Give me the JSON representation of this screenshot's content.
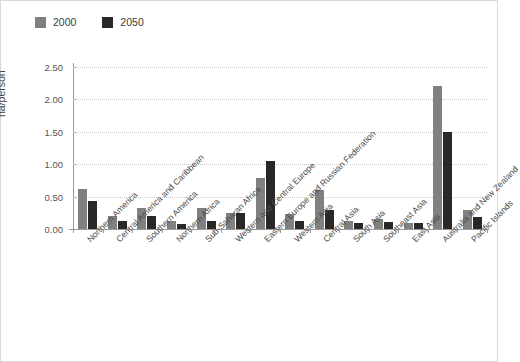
{
  "chart_data": {
    "type": "bar",
    "title": "",
    "xlabel": "",
    "ylabel": "ha/person",
    "ylim": [
      0,
      2.5
    ],
    "ytick_labels": [
      "0.00",
      "0.50",
      "1.00",
      "1.50",
      "2.00",
      "2.50"
    ],
    "ytick_values": [
      0,
      0.5,
      1.0,
      1.5,
      2.0,
      2.5
    ],
    "grid": true,
    "legend_position": "top-left",
    "categories": [
      "Northern America",
      "Central America and Caribbean",
      "Southern America",
      "Northern Africa",
      "Sub-Saharan Africa",
      "Western and Central Europe",
      "Eastern Europe and Russian Federation",
      "Western Asia",
      "Central Asia",
      "South Asia",
      "Southeast Asia",
      "East Asia",
      "Australia and New Zealand",
      "Pacific Islands"
    ],
    "series": [
      {
        "name": "2000",
        "color": "#808080",
        "values": [
          0.61,
          0.2,
          0.33,
          0.13,
          0.33,
          0.25,
          0.78,
          0.23,
          0.6,
          0.12,
          0.15,
          0.1,
          2.2,
          0.3
        ]
      },
      {
        "name": "2050",
        "color": "#282828",
        "values": [
          0.44,
          0.13,
          0.2,
          0.07,
          0.13,
          0.24,
          1.05,
          0.13,
          0.3,
          0.09,
          0.11,
          0.09,
          1.5,
          0.18
        ]
      }
    ]
  },
  "legend": {
    "items": [
      {
        "label": "2000",
        "color": "#808080"
      },
      {
        "label": "2050",
        "color": "#282828"
      }
    ]
  },
  "axes": {
    "y_title": "ha/person"
  }
}
